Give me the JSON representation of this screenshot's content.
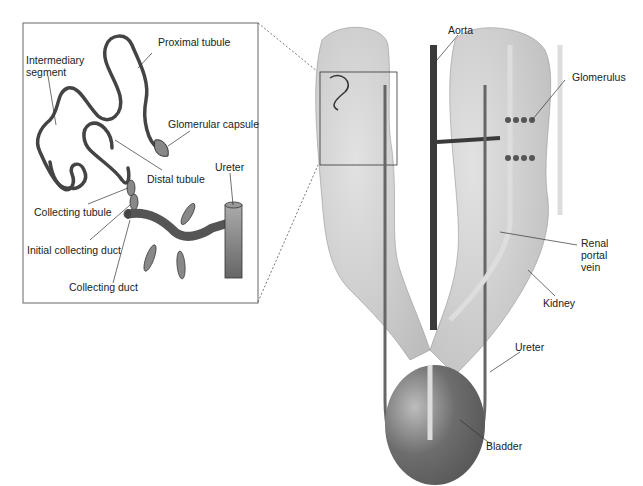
{
  "diagram": {
    "inset_labels": {
      "proximal_tubule": "Proximal tubule",
      "intermediary_segment_1": "Intermediary",
      "intermediary_segment_2": "segment",
      "glomerular_capsule": "Glomerular capsule",
      "distal_tubule": "Distal tubule",
      "ureter": "Ureter",
      "collecting_tubule": "Collecting tubule",
      "initial_collecting_duct": "Initial collecting duct",
      "collecting_duct": "Collecting duct"
    },
    "main_labels": {
      "aorta": "Aorta",
      "glomerulus": "Glomerulus",
      "renal_portal_vein_1": "Renal",
      "renal_portal_vein_2": "portal",
      "renal_portal_vein_3": "vein",
      "kidney": "Kidney",
      "ureter": "Ureter",
      "bladder": "Bladder"
    },
    "colors": {
      "kidney_fill": "#c9c9c9",
      "vessel_dark": "#3a3a3a",
      "vessel_mid": "#6e6e6e",
      "vein_light": "#d6d6d6",
      "bladder": "#6a6a6a"
    }
  }
}
